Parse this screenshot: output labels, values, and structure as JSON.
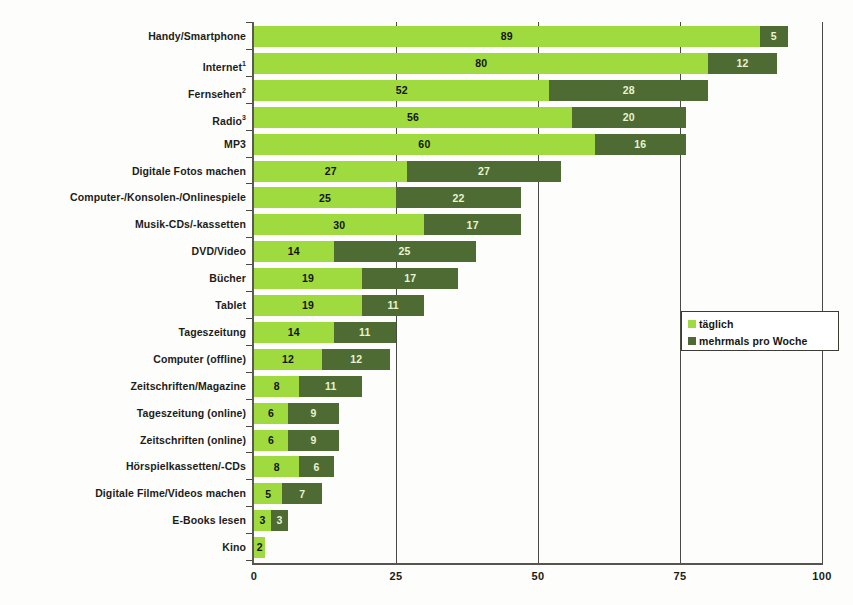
{
  "chart_data": {
    "type": "bar",
    "orientation": "horizontal",
    "stacked": true,
    "title": "",
    "subtitle": "",
    "xlabel": "",
    "ylabel": "",
    "xlim": [
      0,
      100
    ],
    "xticks": [
      "0",
      "25",
      "50",
      "75",
      "100"
    ],
    "grid": true,
    "legend_position": "right-middle",
    "categories": [
      "Handy/Smartphone",
      "Internet",
      "Fernsehen",
      "Radio",
      "MP3",
      "Digitale Fotos machen",
      "Computer-/Konsolen-/Onlinespiele",
      "Musik-CDs/-kassetten",
      "DVD/Video",
      "Bücher",
      "Tablet",
      "Tageszeitung",
      "Computer (offline)",
      "Zeitschriften/Magazine",
      "Tageszeitung (online)",
      "Zeitschriften (online)",
      "Hörspielkassetten/-CDs",
      "Digitale Filme/Videos machen",
      "E-Books lesen",
      "Kino"
    ],
    "category_footnotes": [
      "",
      "1",
      "2",
      "3",
      "",
      "",
      "",
      "",
      "",
      "",
      "",
      "",
      "",
      "",
      "",
      "",
      "",
      "",
      "",
      ""
    ],
    "series": [
      {
        "name": "täglich",
        "color": "#9fda3f",
        "values": [
          89,
          80,
          52,
          56,
          60,
          27,
          25,
          30,
          14,
          19,
          19,
          14,
          12,
          8,
          6,
          6,
          8,
          5,
          3,
          2
        ]
      },
      {
        "name": "mehrmals pro Woche",
        "color": "#4e6b33",
        "values": [
          5,
          12,
          28,
          20,
          16,
          27,
          22,
          17,
          25,
          17,
          11,
          11,
          12,
          11,
          9,
          9,
          6,
          7,
          3,
          0
        ]
      }
    ]
  },
  "legend": {
    "items": [
      {
        "label": "täglich",
        "color": "#9fda3f"
      },
      {
        "label": "mehrmals pro Woche",
        "color": "#4e6b33"
      }
    ]
  },
  "colors": {
    "series_1": "#9fda3f",
    "series_2": "#4e6b33",
    "axis": "#4a4a44",
    "background": "#fdfdfb",
    "label_text": "#1c1c19"
  }
}
